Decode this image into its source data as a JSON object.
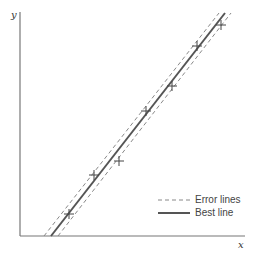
{
  "chart_data": {
    "type": "scatter",
    "title": "",
    "xlabel": "x",
    "ylabel": "y",
    "grid": false,
    "legend_position": "lower right",
    "legend": [
      {
        "label": "Error lines",
        "style": "dashed"
      },
      {
        "label": "Best line",
        "style": "solid"
      }
    ],
    "points_px": [
      {
        "x": 69,
        "y": 214
      },
      {
        "x": 94,
        "y": 175
      },
      {
        "x": 119,
        "y": 161
      },
      {
        "x": 146,
        "y": 111
      },
      {
        "x": 172,
        "y": 86
      },
      {
        "x": 197,
        "y": 46
      },
      {
        "x": 221,
        "y": 25
      }
    ],
    "lines_px": {
      "best": {
        "x1": 51,
        "y1": 236,
        "x2": 225,
        "y2": 13
      },
      "error_low": {
        "x1": 58,
        "y1": 236,
        "x2": 231,
        "y2": 13
      },
      "error_high": {
        "x1": 44,
        "y1": 236,
        "x2": 219,
        "y2": 13
      }
    },
    "axes_px": {
      "origin_x": 20,
      "origin_y": 236,
      "x_end": 245,
      "y_top": 12
    },
    "colors": {
      "best": "#555555",
      "error": "#888888",
      "axis": "#777777",
      "marker": "#444444"
    }
  },
  "labels": {
    "x_axis": "x",
    "y_axis": "y",
    "legend_error": "Error lines",
    "legend_best": "Best line"
  }
}
